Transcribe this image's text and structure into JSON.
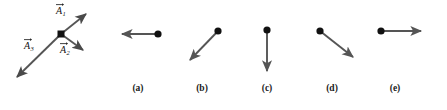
{
  "figure": {
    "type": "physics-vector-diagram",
    "background_color": "#ffffff",
    "arrow_color": "#555555",
    "dot_color": "#111111",
    "label_color": "#1a1a1a",
    "prompt_diagram": {
      "name": "three-vector-diagram",
      "origin": {
        "x": 61,
        "y": 34
      },
      "origin_marker": "square-dot",
      "vectors": [
        {
          "id": "A1",
          "label": "A",
          "subscript": "1",
          "from": {
            "x": 61,
            "y": 34
          },
          "to": {
            "x": 89,
            "y": 11
          },
          "direction": "up-right",
          "label_pos": {
            "x": 57,
            "y": 5
          }
        },
        {
          "id": "A2",
          "label": "A",
          "subscript": "2",
          "from": {
            "x": 61,
            "y": 34
          },
          "to": {
            "x": 86,
            "y": 53
          },
          "direction": "down-right",
          "label_pos": {
            "x": 60,
            "y": 44
          }
        },
        {
          "id": "A3",
          "label": "A",
          "subscript": "3",
          "from": {
            "x": 61,
            "y": 34
          },
          "to": {
            "x": 13,
            "y": 81
          },
          "direction": "down-left",
          "label_pos": {
            "x": 25,
            "y": 41
          }
        }
      ]
    },
    "options": [
      {
        "id": "a",
        "label": "(a)",
        "dot": {
          "x": 158,
          "y": 34
        },
        "tip": {
          "x": 118,
          "y": 34
        },
        "direction": "left",
        "label_pos": {
          "x": 118,
          "y": 84
        }
      },
      {
        "id": "b",
        "label": "(b)",
        "dot": {
          "x": 218,
          "y": 31
        },
        "tip": {
          "x": 186,
          "y": 64
        },
        "direction": "down-left",
        "label_pos": {
          "x": 182,
          "y": 84
        }
      },
      {
        "id": "c",
        "label": "(c)",
        "dot": {
          "x": 267,
          "y": 30
        },
        "tip": {
          "x": 267,
          "y": 76
        },
        "direction": "down",
        "label_pos": {
          "x": 247,
          "y": 84
        }
      },
      {
        "id": "d",
        "label": "(d)",
        "dot": {
          "x": 320,
          "y": 31
        },
        "tip": {
          "x": 358,
          "y": 61
        },
        "direction": "down-right",
        "label_pos": {
          "x": 312,
          "y": 84
        }
      },
      {
        "id": "e",
        "label": "(e)",
        "dot": {
          "x": 381,
          "y": 31
        },
        "tip": {
          "x": 425,
          "y": 31
        },
        "direction": "right",
        "label_pos": {
          "x": 375,
          "y": 84
        }
      }
    ]
  }
}
